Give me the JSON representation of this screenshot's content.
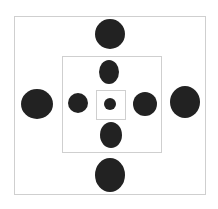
{
  "diagram": {
    "type": "nested-squares-dot-pattern",
    "colors": {
      "background": "#ffffff",
      "frame": "#cfcfcf",
      "dot": "#222222"
    },
    "squares": [
      {
        "id": "outer",
        "x": 14,
        "y": 16,
        "w": 192,
        "h": 179
      },
      {
        "id": "middle",
        "x": 62,
        "y": 56,
        "w": 100,
        "h": 97
      },
      {
        "id": "inner",
        "x": 96,
        "y": 90,
        "w": 30,
        "h": 30
      }
    ],
    "dots": [
      {
        "id": "top-outer",
        "cx": 110,
        "cy": 34,
        "rx": 15,
        "ry": 15
      },
      {
        "id": "top-inner",
        "cx": 109,
        "cy": 72,
        "rx": 10,
        "ry": 12
      },
      {
        "id": "center",
        "cx": 110,
        "cy": 104,
        "rx": 6,
        "ry": 6
      },
      {
        "id": "bottom-inner",
        "cx": 111,
        "cy": 135,
        "rx": 11,
        "ry": 13
      },
      {
        "id": "bottom-outer",
        "cx": 110,
        "cy": 175,
        "rx": 15,
        "ry": 17
      },
      {
        "id": "left-outer",
        "cx": 37,
        "cy": 104,
        "rx": 16,
        "ry": 15
      },
      {
        "id": "left-inner",
        "cx": 78,
        "cy": 103,
        "rx": 10,
        "ry": 10
      },
      {
        "id": "right-inner",
        "cx": 145,
        "cy": 104,
        "rx": 12,
        "ry": 12
      },
      {
        "id": "right-outer",
        "cx": 185,
        "cy": 102,
        "rx": 15,
        "ry": 16
      }
    ]
  }
}
